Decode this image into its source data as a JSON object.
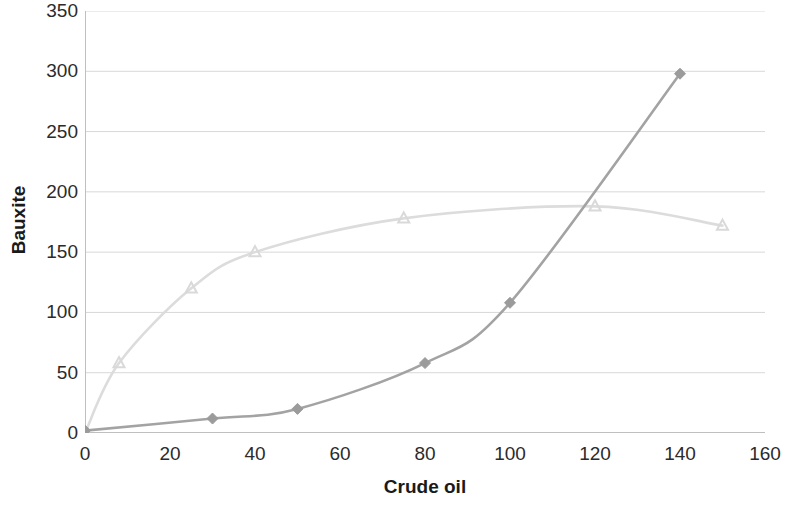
{
  "chart_data": {
    "type": "line",
    "title": "",
    "xlabel": "Crude oil",
    "ylabel": "Bauxite",
    "xlim": [
      0,
      160
    ],
    "ylim": [
      0,
      350
    ],
    "xticks": [
      0,
      20,
      40,
      60,
      80,
      100,
      120,
      140,
      160
    ],
    "yticks": [
      0,
      50,
      100,
      150,
      200,
      250,
      300,
      350
    ],
    "xtick_labels": [
      "0",
      "20",
      "40",
      "60",
      "80",
      "100",
      "120",
      "140",
      "160"
    ],
    "ytick_labels": [
      "0",
      "50",
      "100",
      "150",
      "200",
      "250",
      "300",
      "350"
    ],
    "grid": "horizontal",
    "legend": "none",
    "series": [
      {
        "name": "series-light",
        "marker": "triangle",
        "color": "#d9d9d9",
        "line_color": "#dcdcdc",
        "x": [
          0,
          8,
          25,
          40,
          75,
          120,
          150
        ],
        "y": [
          0,
          58,
          120,
          150,
          178,
          188,
          172
        ]
      },
      {
        "name": "series-dark",
        "marker": "diamond",
        "color": "#9b9b9b",
        "line_color": "#a3a3a3",
        "x": [
          0,
          30,
          50,
          80,
          100,
          140
        ],
        "y": [
          2,
          12,
          20,
          58,
          108,
          298
        ]
      }
    ]
  },
  "axis": {
    "y_title": "Bauxite",
    "x_title": "Crude oil"
  },
  "colors": {
    "axis_line": "#bfbfbf",
    "grid_line": "#d8d8d8",
    "tick_text": "#2b2b2b",
    "title_text": "#1a1a1a",
    "background": "#ffffff"
  }
}
